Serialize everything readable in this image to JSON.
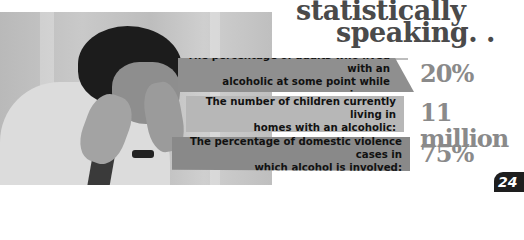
{
  "title": {
    "line1": "statistically",
    "line2": "speaking. . ."
  },
  "stats": [
    {
      "label": "The percentage of adults who lived with an alcoholic at some point while growing up:",
      "line1": "The percentage of adults who lived with an",
      "line2": "alcoholic at some point while growing up:",
      "value": "20%"
    },
    {
      "label": "The number of children currently living in homes with an alcoholic:",
      "line1": "The number of children currently living in",
      "line2": "homes with an alcoholic:",
      "value": "11 million"
    },
    {
      "label": "The percentage of domestic violence cases in which alcohol is involved:",
      "line1": "The percentage of domestic violence cases in",
      "line2": "which alcohol is involved:",
      "value": "75%"
    }
  ],
  "page_number": "24",
  "colors": {
    "title": "#4a4a4a",
    "value": "#8a8a8a",
    "band_dark": "#8f8f8f",
    "band_light": "#b7b7b7",
    "badge": "#1e1e1e"
  },
  "photo": {
    "subject": "stressed man holding head"
  }
}
